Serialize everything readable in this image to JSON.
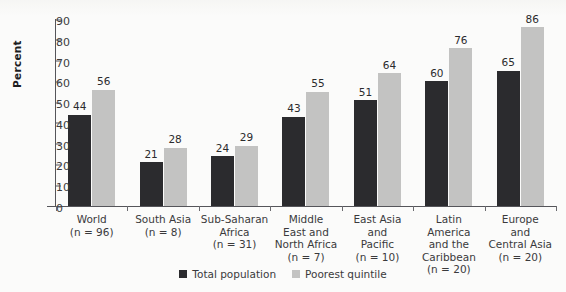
{
  "chart_data": {
    "type": "bar",
    "title": "",
    "subtitle": "",
    "xlabel": "",
    "ylabel": "Percent",
    "ylim": [
      0,
      90
    ],
    "yticks": [
      0,
      10,
      20,
      30,
      40,
      50,
      60,
      70,
      80,
      90
    ],
    "grid": false,
    "legend_position": "bottom-center",
    "categories": [
      {
        "lines": [
          "World"
        ],
        "n": "(n = 96)"
      },
      {
        "lines": [
          "South Asia"
        ],
        "n": "(n = 8)"
      },
      {
        "lines": [
          "Sub-Saharan",
          "Africa"
        ],
        "n": "(n = 31)"
      },
      {
        "lines": [
          "Middle",
          "East and",
          "North Africa"
        ],
        "n": "(n = 7)"
      },
      {
        "lines": [
          "East Asia",
          "and",
          "Pacific"
        ],
        "n": "(n = 10)"
      },
      {
        "lines": [
          "Latin America",
          "and the",
          "Caribbean"
        ],
        "n": "(n = 20)"
      },
      {
        "lines": [
          "Europe",
          "and",
          "Central Asia"
        ],
        "n": "(n = 20)"
      }
    ],
    "series": [
      {
        "name": "Total population",
        "color": "#2b2b2e",
        "values": [
          44,
          21,
          24,
          43,
          51,
          60,
          65
        ]
      },
      {
        "name": "Poorest quintile",
        "color": "#c3c3c2",
        "values": [
          56,
          28,
          29,
          55,
          64,
          76,
          86
        ]
      }
    ]
  }
}
